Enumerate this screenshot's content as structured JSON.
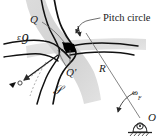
{
  "figure": {
    "kind": "engineering-diagram",
    "width": 163,
    "height": 139,
    "background_color": "#ffffff"
  },
  "colors": {
    "ink": "#1a1a1a",
    "profile_stroke": "#111111",
    "band_fill": "#cfcfcf",
    "band_fill_light": "#dedede",
    "leader_stroke": "#4a4a4a",
    "thin_stroke": "#555555",
    "contact_dot": "#000000",
    "hatch": "#333333",
    "background": "#ffffff"
  },
  "labels": {
    "pitch_circle": "Pitch circle",
    "point_q": "Q",
    "point_q_prime": "Q'",
    "surface_p": "ᵋ9",
    "surface_s": "𝒮",
    "radius": "R",
    "omega_symbol": "ω",
    "omega_subscript": "F",
    "center_o": "O"
  },
  "annotations": {
    "contact_point_marker": "contact-point-dot",
    "velocity_arrow": "sliding-velocity-arrow",
    "rotation_arrow": "angular-velocity-arc-arrow",
    "normal_arrow": "common-normal-arrow",
    "pivot_symbol": "fixed-pivot-bearing"
  }
}
